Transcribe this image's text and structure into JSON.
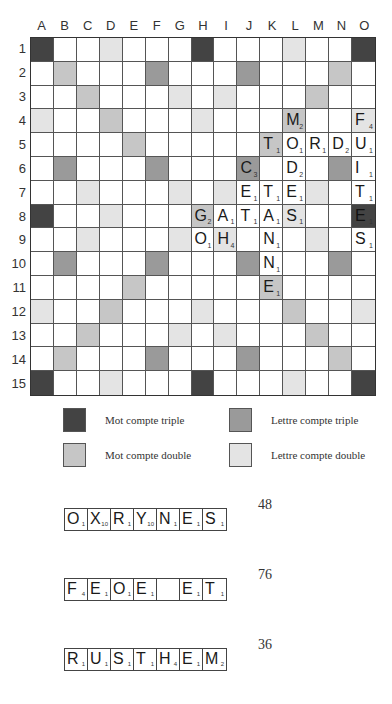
{
  "board": {
    "columns": [
      "A",
      "B",
      "C",
      "D",
      "E",
      "F",
      "G",
      "H",
      "I",
      "J",
      "K",
      "L",
      "M",
      "N",
      "O"
    ],
    "rows": [
      "1",
      "2",
      "3",
      "4",
      "5",
      "6",
      "7",
      "8",
      "9",
      "10",
      "11",
      "12",
      "13",
      "14",
      "15"
    ],
    "premium": {
      "tw": [
        "A1",
        "H1",
        "O1",
        "A8",
        "O8",
        "A15",
        "H15",
        "O15"
      ],
      "dw": [
        "B2",
        "C3",
        "D4",
        "E5",
        "N2",
        "M3",
        "L4",
        "K5",
        "H8",
        "E11",
        "D12",
        "C13",
        "B14",
        "K11",
        "L12",
        "M13",
        "N14"
      ],
      "tl": [
        "F2",
        "J2",
        "B6",
        "F6",
        "J6",
        "N6",
        "B10",
        "F10",
        "J10",
        "N10",
        "F14",
        "J14"
      ],
      "dl": [
        "D1",
        "L1",
        "G3",
        "I3",
        "A4",
        "H4",
        "O4",
        "C7",
        "G7",
        "I7",
        "M7",
        "D8",
        "L8",
        "C9",
        "G9",
        "I9",
        "M9",
        "A12",
        "H12",
        "O12",
        "G13",
        "I13",
        "D15",
        "L15"
      ]
    },
    "tiles": [
      {
        "pos": "L4",
        "letter": "M",
        "value": "2"
      },
      {
        "pos": "O4",
        "letter": "F",
        "value": "4"
      },
      {
        "pos": "K5",
        "letter": "T",
        "value": "1"
      },
      {
        "pos": "L5",
        "letter": "O",
        "value": "1"
      },
      {
        "pos": "M5",
        "letter": "R",
        "value": "1"
      },
      {
        "pos": "N5",
        "letter": "D",
        "value": "2"
      },
      {
        "pos": "O5",
        "letter": "U",
        "value": "1"
      },
      {
        "pos": "J6",
        "letter": "C",
        "value": "3"
      },
      {
        "pos": "L6",
        "letter": "D",
        "value": "2"
      },
      {
        "pos": "O6",
        "letter": "I",
        "value": "1"
      },
      {
        "pos": "J7",
        "letter": "E",
        "value": "1"
      },
      {
        "pos": "K7",
        "letter": "T",
        "value": "1"
      },
      {
        "pos": "L7",
        "letter": "E",
        "value": "1"
      },
      {
        "pos": "O7",
        "letter": "T",
        "value": "1"
      },
      {
        "pos": "H8",
        "letter": "G",
        "value": "2"
      },
      {
        "pos": "I8",
        "letter": "A",
        "value": "1"
      },
      {
        "pos": "J8",
        "letter": "T",
        "value": "1"
      },
      {
        "pos": "K8",
        "letter": "A",
        "value": "1"
      },
      {
        "pos": "L8",
        "letter": "S",
        "value": "1"
      },
      {
        "pos": "O8",
        "letter": "E",
        "value": "1"
      },
      {
        "pos": "H9",
        "letter": "O",
        "value": "1"
      },
      {
        "pos": "I9",
        "letter": "H",
        "value": "4"
      },
      {
        "pos": "K9",
        "letter": "N",
        "value": "1"
      },
      {
        "pos": "O9",
        "letter": "S",
        "value": "1"
      },
      {
        "pos": "K10",
        "letter": "N",
        "value": "1"
      },
      {
        "pos": "K11",
        "letter": "E",
        "value": "1"
      }
    ]
  },
  "legend": {
    "triple_word": "Mot compte triple",
    "triple_letter": "Lettre compte triple",
    "double_word": "Mot compte double",
    "double_letter": "Lettre compte double"
  },
  "words": [
    {
      "tiles": [
        {
          "l": "O",
          "v": "1"
        },
        {
          "l": "X",
          "v": "10"
        },
        {
          "l": "R",
          "v": "1"
        },
        {
          "l": "Y",
          "v": "10"
        },
        {
          "l": "N",
          "v": "1"
        },
        {
          "l": "E",
          "v": "1"
        },
        {
          "l": "S",
          "v": "1"
        }
      ],
      "score": "48"
    },
    {
      "tiles": [
        {
          "l": "F",
          "v": "4"
        },
        {
          "l": "E",
          "v": "1"
        },
        {
          "l": "O",
          "v": "1"
        },
        {
          "l": "E",
          "v": "1"
        },
        {
          "l": "",
          "v": ""
        },
        {
          "l": "E",
          "v": "1"
        },
        {
          "l": "T",
          "v": "1"
        }
      ],
      "score": "76"
    },
    {
      "tiles": [
        {
          "l": "R",
          "v": "1"
        },
        {
          "l": "U",
          "v": "1"
        },
        {
          "l": "S",
          "v": "1"
        },
        {
          "l": "T",
          "v": "1"
        },
        {
          "l": "H",
          "v": "4"
        },
        {
          "l": "E",
          "v": "1"
        },
        {
          "l": "M",
          "v": "2"
        }
      ],
      "score": "36"
    }
  ],
  "colors": {
    "triple_word": "#434343",
    "triple_letter": "#9a9a9a",
    "double_word": "#c6c6c6",
    "double_letter": "#e4e4e4"
  }
}
